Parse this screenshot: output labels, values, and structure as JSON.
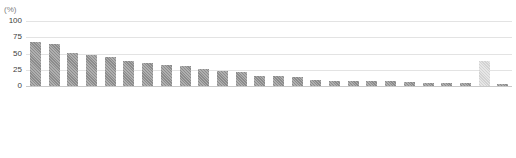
{
  "chart_data": {
    "type": "bar",
    "title": "",
    "subtitle": "",
    "xlabel": "",
    "ylabel": "(%)",
    "unit_label": "(%)",
    "ylim": [
      0,
      100
    ],
    "yticks": [
      100,
      75,
      50,
      25,
      0
    ],
    "grid": true,
    "legend": "none",
    "orientation": "vertical",
    "bar_color": "#8c8c8c",
    "highlight_color": "#d2d2d2",
    "gridline_color": "#e3e3e3",
    "categories": [
      "Cyprus",
      "Luxembourg",
      "Germany",
      "Sweden",
      "Denmark",
      "Slovenia",
      "Belgium",
      "Malta",
      "United Kingdom",
      "Netherlands",
      "Lithuania",
      "Austria",
      "Estonia",
      "Finland",
      "Czech Republic",
      "Latvia",
      "Hungary",
      "Italy",
      "Poland",
      "Spain",
      "France",
      "Portugal",
      "Greece",
      "Romania",
      "Norway",
      "Croatia"
    ],
    "values": [
      67,
      64,
      50,
      47,
      45,
      39,
      35,
      33,
      31,
      26,
      23,
      22,
      16,
      16,
      14,
      9,
      8,
      8,
      7,
      7,
      6,
      5,
      5,
      4,
      39,
      3
    ],
    "highlight_categories": [
      "Norway"
    ]
  }
}
